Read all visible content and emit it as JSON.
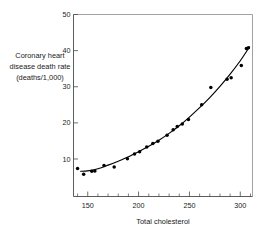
{
  "chart_data": {
    "type": "scatter",
    "title": "",
    "xlabel": "Total cholesterol",
    "ylabel": "Coronary heart disease death rate (deaths/1,000)",
    "ylabel_lines": [
      "Coronary heart",
      "disease death rate",
      "(deaths/1,000)"
    ],
    "xlim": [
      136,
      312
    ],
    "ylim": [
      3,
      50
    ],
    "grid": false,
    "legend": null,
    "x_ticks": [
      150,
      200,
      250,
      300
    ],
    "x_tick_labels": [
      "150",
      "200",
      "250",
      "300"
    ],
    "x_minor_ticks": [
      140,
      160,
      170,
      180,
      190,
      210,
      220,
      230,
      240,
      260,
      270,
      280,
      290,
      310
    ],
    "y_ticks": [
      10,
      20,
      30,
      40,
      50
    ],
    "y_tick_labels": [
      "10",
      "20",
      "30",
      "40",
      "50"
    ],
    "series": [
      {
        "name": "Observed death rate",
        "type": "scatter",
        "marker": "filled-circle",
        "color": "#000000",
        "points": [
          {
            "x": 140,
            "y": 7.4
          },
          {
            "x": 146,
            "y": 5.8
          },
          {
            "x": 154,
            "y": 6.6
          },
          {
            "x": 157,
            "y": 6.7
          },
          {
            "x": 166,
            "y": 8.2
          },
          {
            "x": 176,
            "y": 7.8
          },
          {
            "x": 189,
            "y": 10.1
          },
          {
            "x": 196,
            "y": 11.4
          },
          {
            "x": 201,
            "y": 12.0
          },
          {
            "x": 208,
            "y": 13.3
          },
          {
            "x": 214,
            "y": 14.3
          },
          {
            "x": 219,
            "y": 14.9
          },
          {
            "x": 228,
            "y": 16.6
          },
          {
            "x": 234,
            "y": 18.1
          },
          {
            "x": 238,
            "y": 19.0
          },
          {
            "x": 243,
            "y": 19.7
          },
          {
            "x": 249,
            "y": 20.9
          },
          {
            "x": 262,
            "y": 25.0
          },
          {
            "x": 271,
            "y": 29.8
          },
          {
            "x": 287,
            "y": 32.1
          },
          {
            "x": 291,
            "y": 32.5
          },
          {
            "x": 301,
            "y": 35.9
          },
          {
            "x": 306,
            "y": 40.6
          },
          {
            "x": 308,
            "y": 40.8
          }
        ]
      },
      {
        "name": "Fitted curve",
        "type": "line",
        "color": "#000000",
        "points": [
          {
            "x": 143,
            "y": 6.6
          },
          {
            "x": 150,
            "y": 6.7
          },
          {
            "x": 160,
            "y": 7.3
          },
          {
            "x": 170,
            "y": 8.3
          },
          {
            "x": 180,
            "y": 9.4
          },
          {
            "x": 190,
            "y": 10.6
          },
          {
            "x": 200,
            "y": 12.0
          },
          {
            "x": 210,
            "y": 13.5
          },
          {
            "x": 220,
            "y": 15.2
          },
          {
            "x": 230,
            "y": 17.1
          },
          {
            "x": 240,
            "y": 19.2
          },
          {
            "x": 250,
            "y": 21.6
          },
          {
            "x": 260,
            "y": 24.2
          },
          {
            "x": 270,
            "y": 27.0
          },
          {
            "x": 280,
            "y": 30.1
          },
          {
            "x": 290,
            "y": 33.5
          },
          {
            "x": 300,
            "y": 37.2
          },
          {
            "x": 309,
            "y": 41.0
          }
        ]
      }
    ]
  },
  "figure": {
    "background_color": "#ffffff",
    "axis_color": "#4a4a4a",
    "marker_color": "#000000"
  }
}
